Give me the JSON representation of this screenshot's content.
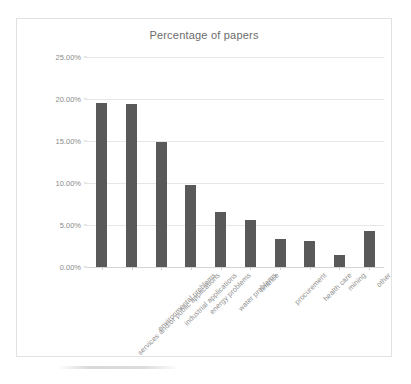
{
  "chart_data": {
    "type": "bar",
    "title": "Percentage of papers",
    "xlabel": "",
    "ylabel": "",
    "ylim": [
      0,
      25
    ],
    "ytick_labels": [
      "0.00%",
      "5.00%",
      "10.00%",
      "15.00%",
      "20.00%",
      "25.00%"
    ],
    "ytick_values": [
      0,
      5,
      10,
      15,
      20,
      25
    ],
    "grid": true,
    "legend": false,
    "bar_color": "#595959",
    "categories": [
      "services and/or public applications",
      "environmental problems",
      "industrial applications",
      "energy problems",
      "water problems",
      "finance",
      "procurement",
      "health care",
      "mining",
      "other"
    ],
    "values": [
      19.5,
      19.35,
      14.9,
      9.75,
      6.5,
      5.55,
      3.35,
      3.05,
      1.45,
      4.25
    ],
    "value_labels": [
      "19.50%",
      "19.35%",
      "14.90%",
      "9.75%",
      "6.50%",
      "5.55%",
      "3.35%",
      "3.05%",
      "1.45%",
      "4.25%"
    ]
  }
}
